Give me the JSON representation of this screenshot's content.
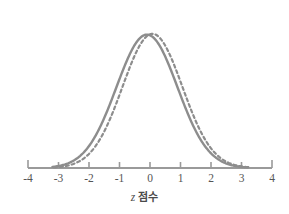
{
  "chart_data": {
    "type": "line",
    "title": "",
    "subtitle": "",
    "xlabel_var": "z",
    "xlabel_text": "점수",
    "xlabel_full": "z 점수",
    "ylabel": "",
    "xlim": [
      -4,
      4
    ],
    "ylim": [
      0,
      1
    ],
    "xticks": [
      -4,
      -3,
      -2,
      -1,
      0,
      1,
      2,
      3,
      4
    ],
    "xtick_labels": [
      "-4",
      "-3",
      "-2",
      "-1",
      "0",
      "1",
      "2",
      "3",
      "4"
    ],
    "yticks": [],
    "ytick_labels": [],
    "grid": false,
    "legend": false,
    "legend_position": "none",
    "axis_color": "#9a9a9a",
    "curve_color": "#8d8d8d",
    "background": "#ffffff",
    "annotations": [],
    "series": [
      {
        "name": "solid-normal-curve",
        "style": "solid",
        "color": "#8d8d8d",
        "linewidth": 2.4,
        "mean": -0.1,
        "sd": 1.0,
        "x": [
          -3.2,
          -3.0,
          -2.8,
          -2.6,
          -2.4,
          -2.2,
          -2.0,
          -1.8,
          -1.6,
          -1.4,
          -1.2,
          -1.0,
          -0.8,
          -0.6,
          -0.4,
          -0.2,
          0.0,
          0.2,
          0.4,
          0.6,
          0.8,
          1.0,
          1.2,
          1.4,
          1.6,
          1.8,
          2.0,
          2.2,
          2.4,
          2.6,
          2.8,
          3.0,
          3.2
        ],
        "values": [
          0.009,
          0.015,
          0.024,
          0.037,
          0.055,
          0.079,
          0.111,
          0.15,
          0.198,
          0.255,
          0.319,
          0.39,
          0.463,
          0.536,
          0.606,
          0.67,
          0.726,
          0.773,
          0.809,
          0.835,
          0.85,
          0.855,
          0.85,
          0.835,
          0.809,
          0.773,
          0.726,
          0.67,
          0.606,
          0.536,
          0.463,
          0.39,
          0.319
        ]
      },
      {
        "name": "dashed-normal-curve",
        "style": "dashed",
        "color": "#8d8d8d",
        "linewidth": 2.2,
        "dasharray": "3 3",
        "mean": 0.08,
        "sd": 0.98,
        "x": [
          -3.15,
          -2.9,
          -2.7,
          -2.5,
          -2.3,
          -2.1,
          -1.9,
          -1.7,
          -1.5,
          -1.3,
          -1.1,
          -0.9,
          -0.7,
          -0.5,
          -0.3,
          -0.1,
          0.1,
          0.3,
          0.5,
          0.7,
          0.9,
          1.1,
          1.3,
          1.5,
          1.7,
          1.9,
          2.1,
          2.3,
          2.5,
          2.7,
          2.9,
          3.1,
          3.25
        ],
        "values": [
          0.008,
          0.013,
          0.021,
          0.033,
          0.05,
          0.072,
          0.102,
          0.139,
          0.185,
          0.24,
          0.303,
          0.373,
          0.447,
          0.521,
          0.594,
          0.662,
          0.722,
          0.773,
          0.813,
          0.841,
          0.857,
          0.86,
          0.851,
          0.831,
          0.8,
          0.76,
          0.712,
          0.657,
          0.597,
          0.535,
          0.472,
          0.409,
          0.348
        ]
      }
    ]
  }
}
